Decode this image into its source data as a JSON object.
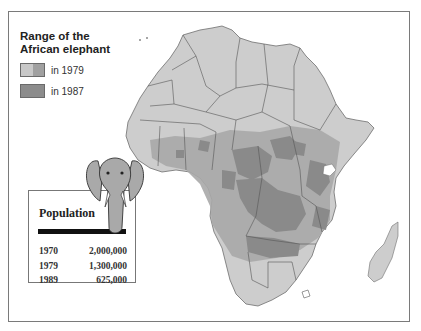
{
  "legend": {
    "title_line1": "Range of the",
    "title_line2": "African elephant",
    "items": [
      {
        "label": "in 1979",
        "colors": [
          "#c8c8c8",
          "#a0a0a0"
        ]
      },
      {
        "label": "in 1987",
        "colors": [
          "#8c8c8c"
        ]
      }
    ]
  },
  "population": {
    "title": "Population",
    "rows": [
      {
        "year": "1970",
        "value": "2,000,000"
      },
      {
        "year": "1979",
        "value": "1,300,000"
      },
      {
        "year": "1989",
        "value": "625,000"
      }
    ]
  },
  "colors": {
    "land": "#cdcdcd",
    "range_1979": "#a8a8a8",
    "range_1987": "#8a8a8a",
    "border": "#555555",
    "frame": "#7a7a7a"
  },
  "map": {
    "subject": "Africa",
    "features": [
      "Madagascar",
      "Lake Victoria"
    ]
  }
}
